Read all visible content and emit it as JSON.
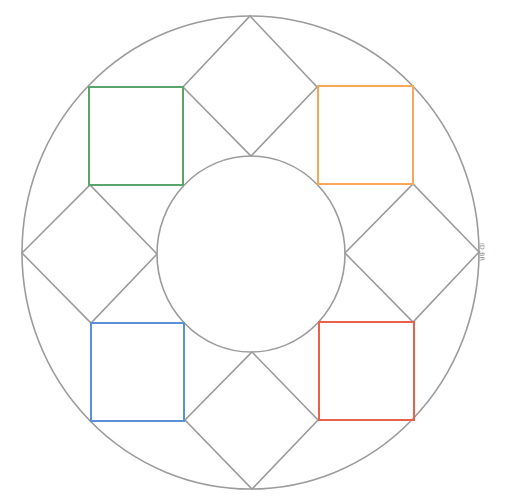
{
  "diagram": {
    "title": "",
    "colors": {
      "outline": "#9b9b9b",
      "green": "#5aa36a",
      "orange": "#f5a85a",
      "blue": "#5b8fd6",
      "red": "#e8614a"
    },
    "outer_circle": {
      "cx": 250.5,
      "cy": 252.5,
      "rx": 228.5,
      "ry": 236.5
    },
    "inner_circle": {
      "cx": 251,
      "cy": 254,
      "rx": 94,
      "ry": 98
    },
    "diamonds": [
      {
        "name": "top",
        "points": "250,16 317,87 251,156 183,87"
      },
      {
        "name": "left",
        "points": "22,253 90,185 157,254 91,323"
      },
      {
        "name": "right",
        "points": "479,252 413,184 345,253 413,322"
      },
      {
        "name": "bottom",
        "points": "252,352 318,420 252,489 185,420"
      }
    ],
    "squares": [
      {
        "name": "green",
        "x": 89,
        "y": 87,
        "w": 94,
        "h": 98,
        "color": "#5aa36a"
      },
      {
        "name": "orange",
        "x": 318,
        "y": 86,
        "w": 95,
        "h": 98,
        "color": "#f5a85a"
      },
      {
        "name": "blue",
        "x": 91,
        "y": 323,
        "w": 93,
        "h": 98,
        "color": "#5b8fd6"
      },
      {
        "name": "red",
        "x": 319,
        "y": 322,
        "w": 95,
        "h": 98,
        "color": "#e8614a"
      }
    ],
    "credit_text": "ID:BR"
  }
}
